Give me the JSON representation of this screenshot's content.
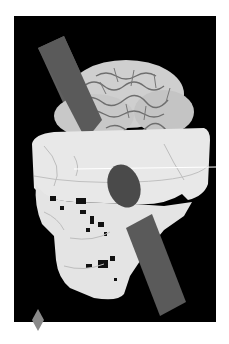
{
  "image": {
    "alt": "3D rendering of a skull with brain exposed and an iron rod passing through from the cheek to the top of the head",
    "background_color": "#000000",
    "page_background": "#ffffff",
    "colors": {
      "bone": "#e8e8e8",
      "bone_shadow": "#bdbdbd",
      "brain": "#cfcfcf",
      "brain_folds": "#6e6e6e",
      "rod": "#5a5a5a",
      "marker": "#8a8a8a"
    }
  },
  "marker": {
    "shape": "diamond"
  }
}
